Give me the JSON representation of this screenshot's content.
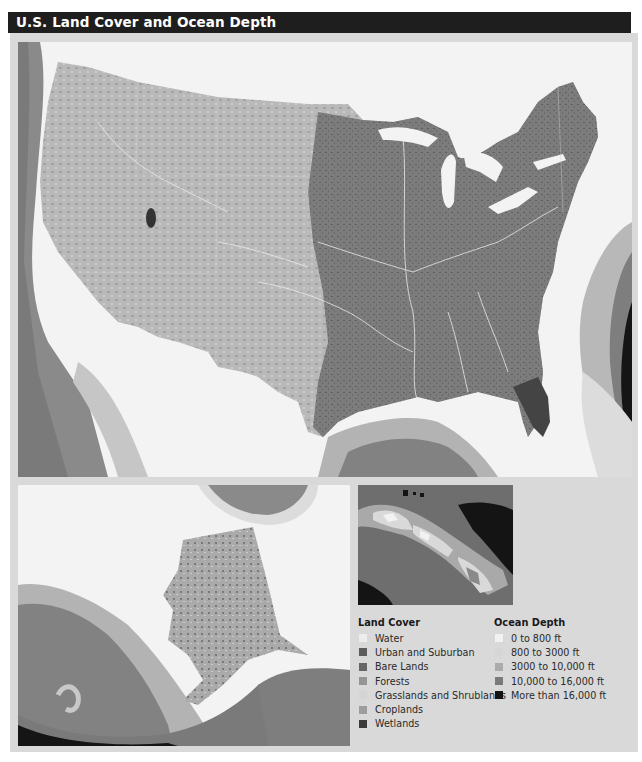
{
  "title": "U.S. Land Cover and Ocean Depth",
  "maps": {
    "main": {
      "region": "Contiguous United States"
    },
    "alaska": {
      "region": "Alaska"
    },
    "hawaii": {
      "region": "Hawaii"
    }
  },
  "legend": {
    "land_cover": {
      "title": "Land Cover",
      "items": [
        {
          "label": "Water",
          "color": "#ededed"
        },
        {
          "label": "Urban and Suburban",
          "color": "#5c5c5c"
        },
        {
          "label": "Bare Lands",
          "color": "#666666"
        },
        {
          "label": "Forests",
          "color": "#959595"
        },
        {
          "label": "Grasslands and Shrublands",
          "color": "#d4d4d4"
        },
        {
          "label": "Croplands",
          "color": "#9e9e9e"
        },
        {
          "label": "Wetlands",
          "color": "#3a3a3a"
        }
      ]
    },
    "ocean_depth": {
      "title": "Ocean Depth",
      "items": [
        {
          "label": "0 to 800 ft",
          "color": "#f2f2f2"
        },
        {
          "label": "800 to 3000 ft",
          "color": "#d6d6d6"
        },
        {
          "label": "3000 to 10,000 ft",
          "color": "#ababab"
        },
        {
          "label": "10,000 to 16,000 ft",
          "color": "#7a7a7a"
        },
        {
          "label": "More than 16,000 ft",
          "color": "#141414"
        }
      ]
    }
  }
}
